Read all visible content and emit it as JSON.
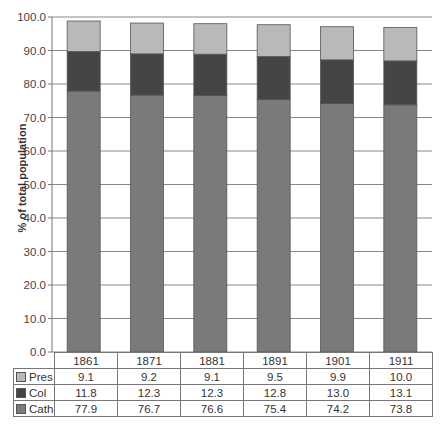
{
  "chart_data": {
    "type": "bar",
    "stacked": true,
    "title": "",
    "xlabel": "",
    "ylabel": "% of total population",
    "ylim": [
      0,
      100
    ],
    "yticks": [
      "0.0",
      "10.0",
      "20.0",
      "30.0",
      "40.0",
      "50.0",
      "60.0",
      "70.0",
      "80.0",
      "90.0",
      "100.0"
    ],
    "grid": true,
    "legend_position": "data-table (left of table rows)",
    "categories": [
      "1861",
      "1871",
      "1881",
      "1891",
      "1901",
      "1911"
    ],
    "series": [
      {
        "name": "Cath",
        "color": "#7a7a7a",
        "values": [
          77.9,
          76.7,
          76.6,
          75.4,
          74.2,
          73.8
        ]
      },
      {
        "name": "Col",
        "color": "#454545",
        "values": [
          11.8,
          12.3,
          12.3,
          12.8,
          13.0,
          13.1
        ]
      },
      {
        "name": "Pres",
        "color": "#b9b9b9",
        "values": [
          9.1,
          9.2,
          9.1,
          9.5,
          9.9,
          10.0
        ]
      }
    ],
    "table_rows": [
      {
        "name": "Pres",
        "values": [
          "9.1",
          "9.2",
          "9.1",
          "9.5",
          "9.9",
          "10.0"
        ]
      },
      {
        "name": "Col",
        "values": [
          "11.8",
          "12.3",
          "12.3",
          "12.8",
          "13.0",
          "13.1"
        ]
      },
      {
        "name": "Cath",
        "values": [
          "77.9",
          "76.7",
          "76.6",
          "75.4",
          "74.2",
          "73.8"
        ]
      }
    ]
  }
}
